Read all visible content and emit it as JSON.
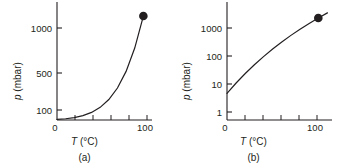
{
  "figure": {
    "panels": [
      {
        "caption": "(a)",
        "xlabel_symbol": "T",
        "xlabel_unit": "(°C)",
        "ylabel_symbol": "p",
        "ylabel_unit": "(mbar)",
        "y_scale": "linear",
        "y_ticks": [
          "100",
          "500",
          "1000"
        ],
        "x_ticks": [
          "0",
          "100"
        ]
      },
      {
        "caption": "(b)",
        "xlabel_symbol": "T",
        "xlabel_unit": "(°C)",
        "ylabel_symbol": "p",
        "ylabel_unit": "(mbar)",
        "y_scale": "log",
        "y_ticks": [
          "1",
          "10",
          "100",
          "1000"
        ],
        "x_ticks": [
          "0",
          "100"
        ]
      }
    ]
  },
  "chart_data": [
    {
      "type": "line",
      "title": "",
      "xlabel": "T (°C)",
      "ylabel": "p (mbar)",
      "xscale": "linear",
      "yscale": "linear",
      "xlim": [
        0,
        110
      ],
      "ylim": [
        0,
        1150
      ],
      "xticks": [
        0,
        100
      ],
      "xminorticks": [
        20,
        40,
        60,
        80
      ],
      "yticks": [
        100,
        500,
        1000
      ],
      "grid": false,
      "legend": null,
      "series": [
        {
          "name": "saturated vapour pressure of water",
          "x": [
            0,
            10,
            20,
            30,
            40,
            50,
            60,
            70,
            80,
            90,
            100
          ],
          "y": [
            6.1,
            12.3,
            23.4,
            42.4,
            73.8,
            123.4,
            199.3,
            311.7,
            473.7,
            701.1,
            1013.0
          ]
        }
      ],
      "markers": [
        {
          "name": "boiling-point-marker",
          "x": 100,
          "y": 1013,
          "style": "filled-circle"
        }
      ]
    },
    {
      "type": "line",
      "title": "",
      "xlabel": "T (°C)",
      "ylabel": "p (mbar)",
      "xscale": "linear",
      "yscale": "log",
      "xlim": [
        0,
        115
      ],
      "ylim": [
        1,
        3000
      ],
      "xticks": [
        0,
        100
      ],
      "xminorticks": [
        20,
        40,
        60,
        80
      ],
      "yticks": [
        1,
        10,
        100,
        1000
      ],
      "grid": false,
      "legend": null,
      "series": [
        {
          "name": "saturated vapour pressure of water (log scale)",
          "x": [
            0,
            10,
            20,
            30,
            40,
            50,
            60,
            70,
            80,
            90,
            100,
            110
          ],
          "y": [
            6.1,
            12.3,
            23.4,
            42.4,
            73.8,
            123.4,
            199.3,
            311.7,
            473.7,
            701.1,
            1013.0,
            1433.0
          ]
        }
      ],
      "markers": [
        {
          "name": "boiling-point-marker",
          "x": 100,
          "y": 1013,
          "style": "filled-circle"
        }
      ]
    }
  ]
}
